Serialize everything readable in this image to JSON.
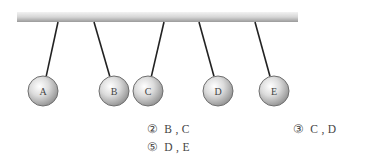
{
  "diagram": {
    "type": "pendulum-balls",
    "bar": {
      "x1": 17,
      "x2": 298,
      "y": 12,
      "height": 10
    },
    "balls": [
      {
        "label": "A",
        "cx": 43,
        "cy": 91,
        "r": 15,
        "anchor_x": 58
      },
      {
        "label": "B",
        "cx": 114,
        "cy": 91,
        "r": 15,
        "anchor_x": 94
      },
      {
        "label": "C",
        "cx": 148,
        "cy": 91,
        "r": 15,
        "anchor_x": 164
      },
      {
        "label": "D",
        "cx": 218,
        "cy": 91,
        "r": 15,
        "anchor_x": 199
      },
      {
        "label": "E",
        "cx": 274,
        "cy": 91,
        "r": 15,
        "anchor_x": 255
      }
    ]
  },
  "options": [
    {
      "num": "②",
      "text": "B , C"
    },
    {
      "num": "③",
      "text": "C , D"
    },
    {
      "num": "⑤",
      "text": "D , E"
    }
  ]
}
